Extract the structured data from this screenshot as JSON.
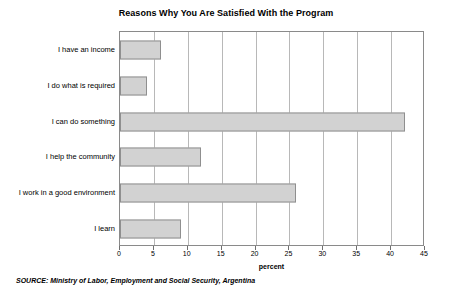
{
  "chart_data": {
    "type": "bar",
    "orientation": "horizontal",
    "title": "Reasons Why You Are Satisfied With the Program",
    "xlabel": "percent",
    "ylabel": "",
    "xlim": [
      0,
      45
    ],
    "xticks": [
      0,
      5,
      10,
      15,
      20,
      25,
      30,
      35,
      40,
      45
    ],
    "xtick_labels": [
      "0",
      "5",
      "10",
      "15",
      "20",
      "25",
      "30",
      "35",
      "40",
      "45"
    ],
    "grid": true,
    "grid_axis": "x",
    "legend": false,
    "categories": [
      "I have an income",
      "I do what is required",
      "I can do something",
      "I help the community",
      "I work in a good environment",
      "I learn"
    ],
    "values": [
      6,
      4,
      42,
      12,
      26,
      9
    ],
    "bar_color": "#d2d2d2",
    "bar_edge_color": "#8f8f8f",
    "axis_color": "#8a8a8a",
    "grid_color": "#b8b8b8"
  },
  "footer": {
    "source": "SOURCE: Ministry of Labor, Employment and Social Security, Argentina"
  }
}
